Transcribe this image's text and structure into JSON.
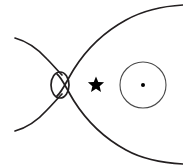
{
  "figure": {
    "background_color": "#ffffff",
    "width": 183,
    "height": 167,
    "line_color": "#231f20",
    "accent_color": "#000000",
    "circle_stroke_color": "#4a4a4a"
  },
  "elements": {
    "closed_lobe": {
      "name": "closed-field-lobe",
      "description": "Large teardrop shaped closed boundary opening to the right edge",
      "stroke_width": 1.7
    },
    "upper_cusp": {
      "name": "upper-cusp-line",
      "description": "Open field line curving from upper-left toward the X-point",
      "start_x": 15,
      "start_y": 38,
      "end_x": 62,
      "end_y": 74
    },
    "lower_cusp": {
      "name": "lower-cusp-line",
      "description": "Open field line curving from lower-left toward the X-point",
      "start_x": 15,
      "start_y": 131,
      "end_x": 62,
      "end_y": 96
    },
    "plasmoid": {
      "name": "plasmoid-ellipse",
      "center_x": 60,
      "center_y": 85,
      "radius_x": 9,
      "radius_y": 13
    },
    "star": {
      "name": "star-marker",
      "center_x": 96,
      "center_y": 85,
      "size": 17,
      "points": 5,
      "fill": "#000000"
    },
    "orbit": {
      "name": "orbit-circle",
      "center_x": 143,
      "center_y": 85,
      "radius": 23
    },
    "orbit_center": {
      "name": "orbit-center-dot",
      "center_x": 143,
      "center_y": 85,
      "radius": 2
    }
  },
  "labels": {
    "none_visible": ""
  }
}
